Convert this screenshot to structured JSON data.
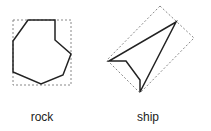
{
  "shapes": [
    {
      "name": "rock",
      "label": "rock"
    },
    {
      "name": "ship",
      "label": "ship"
    }
  ],
  "colors": {
    "stroke": "#222222",
    "bbox": "#888888"
  }
}
